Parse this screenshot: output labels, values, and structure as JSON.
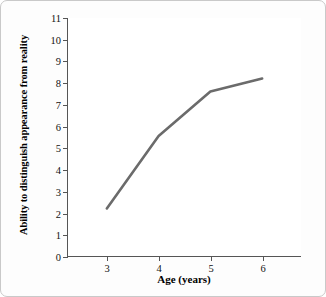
{
  "chart_data": {
    "type": "line",
    "title": "",
    "xlabel": "Age (years)",
    "ylabel": "Ability to distinguish appearance from reality",
    "x": [
      3,
      4,
      5,
      6
    ],
    "values": [
      2.2,
      5.55,
      7.6,
      8.2
    ],
    "xlim": [
      2.25,
      6.75
    ],
    "ylim": [
      0,
      11
    ],
    "xticks": [
      3,
      4,
      5,
      6
    ],
    "xtick_labels": [
      "3",
      "4",
      "5",
      "6"
    ],
    "yticks": [
      0,
      1,
      2,
      3,
      4,
      5,
      6,
      7,
      8,
      9,
      10,
      11
    ],
    "ytick_labels": [
      "0",
      "1",
      "2",
      "3",
      "4",
      "5",
      "6",
      "7",
      "8",
      "9",
      "10",
      "11"
    ],
    "grid": false,
    "legend": false,
    "series": [
      {
        "name": "",
        "values": [
          2.2,
          5.55,
          7.6,
          8.2
        ],
        "color": "#6b6b6b",
        "line_width": 2.6,
        "markers": false
      }
    ],
    "annotations": []
  },
  "style": {
    "line_color": "#6b6b6b",
    "axis_color": "#555555",
    "text_color": "#000000",
    "plot_background": "#ffffff",
    "card_background": "#fdfdfd",
    "card_border_color": "#c9c9c9"
  }
}
